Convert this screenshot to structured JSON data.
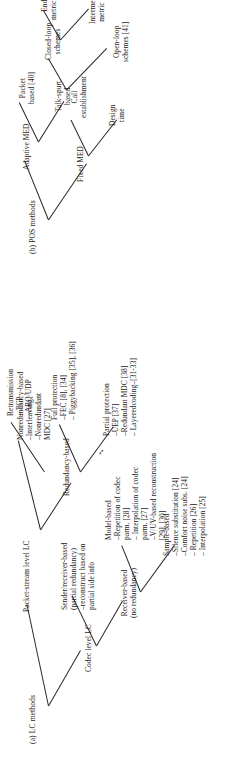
{
  "figure": {
    "panels": [
      {
        "id": "panel-a",
        "caption": "(a) LC methods",
        "root": "LC methods",
        "nodes": {
          "codec_level": "Codec level LC",
          "packet_stream_level": "Packet-stream level LC",
          "receiver_based_l1": "Receiver-based",
          "receiver_based_l2": "(no redundancy)",
          "sender_receiver_l1": "Sender/receiver-based",
          "sender_receiver_l2": "(partial redundancy)",
          "sender_receiver_l3": "–reconstruct based on",
          "sender_receiver_l4": "partial side info",
          "redundancy_based": "Redundancy-based",
          "nonredundancy_based_l1": "Nonredundancy-based",
          "nonredundancy_based_l2": "–Interleaving",
          "nonredundancy_based_l3": "–Nonredundant",
          "nonredundancy_based_l4": "MDC [27]",
          "sample_based_l1": "Sample-based",
          "sample_based_l2": "–Silence substitution [24]",
          "sample_based_l3": "–Comfort noise subs. [24]",
          "sample_based_l4": "– Repetition [26]",
          "sample_based_l5": "– Interpolation [25]",
          "model_based_l1": "Model-based",
          "model_based_l2": "–Repetition of codec",
          "model_based_l3": "parm. [28]",
          "model_based_l4": "– Interpolation of codec",
          "model_based_l5": "parm. [27]",
          "model_based_l6": "–V/UV-based reconstruction",
          "model_based_l7": "[29], [30]",
          "partial_protection_l1": "Partial protection",
          "partial_protection_l2": "–UEP [37]",
          "partial_protection_l3": "–Redundant MDC [38]",
          "partial_protection_l4": "– Layeredcoding–[31-33]",
          "full_protection_l1": "Full protection",
          "full_protection_l2": "–FEC [8], [34]",
          "full_protection_l3": "– Piggybacking [35], [36]",
          "retransmission_l1": "Retransmission",
          "retransmission_l2": "– TCP",
          "retransmission_l3": "–ARQ/UDP"
        }
      },
      {
        "id": "panel-b",
        "caption": "(b) POS methods",
        "root": "POS methods",
        "nodes": {
          "fixed_med": "Fixed MED",
          "adaptive_med": "Adaptive MED",
          "design_time_l1": "Design",
          "design_time_l2": "time",
          "call_establishment_l1": "Call",
          "call_establishment_l2": "establishment",
          "talkspurt_l1": "Talk-spurt",
          "talkspurt_l2": "based",
          "packet_based_l1": "Packet",
          "packet_based_l2": "based [40]",
          "open_loop_l1": "Open-loop",
          "open_loop_l2": "schemes [41]",
          "closed_loop_l1": "Closed-loop",
          "closed_loop_l2": "schemes",
          "intermediate_l1": "Intermediate",
          "intermediate_l2": "metric [39]",
          "end_to_end_l1": "End-to-end",
          "end_to_end_l2": "metric [13], [15]"
        }
      }
    ],
    "symbols": {
      "bidirectional_arrow": "↔"
    },
    "colors": {
      "ink": "#1c1c1c",
      "line": "#262626",
      "background": "#ffffff"
    }
  }
}
